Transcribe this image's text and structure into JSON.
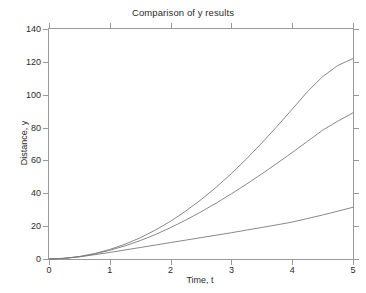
{
  "chart_data": {
    "type": "line",
    "title": "Comparison of y results",
    "xlabel": "Time, t",
    "ylabel": "Distance, y",
    "xlim": [
      0,
      5
    ],
    "ylim": [
      0,
      140
    ],
    "xticks": [
      0,
      1,
      2,
      3,
      4,
      5
    ],
    "yticks": [
      0,
      20,
      40,
      60,
      80,
      100,
      120,
      140
    ],
    "xtick_labels": [
      "0",
      "1",
      "2",
      "3",
      "4",
      "5"
    ],
    "ytick_labels": [
      "0",
      "20",
      "40",
      "60",
      "80",
      "100",
      "120",
      "140"
    ],
    "grid": false,
    "legend": "none",
    "line_color": "#7a7a7a",
    "axis_color": "#9a9a9a",
    "text_color": "#2b2b2b",
    "background": "#ffffff",
    "x": [
      0,
      0.25,
      0.5,
      0.75,
      1,
      1.25,
      1.5,
      1.75,
      2,
      2.25,
      2.5,
      2.75,
      3,
      3.25,
      3.5,
      3.75,
      4,
      4.25,
      4.5,
      4.75,
      5
    ],
    "series": [
      {
        "name": "curve-1",
        "values": [
          0,
          0.4,
          1.5,
          3.3,
          5.8,
          9.0,
          12.9,
          17.6,
          23.0,
          29.2,
          36.1,
          43.7,
          52.0,
          61.0,
          70.6,
          80.7,
          91.2,
          101.8,
          111.0,
          117.8,
          122.0
        ]
      },
      {
        "name": "curve-2",
        "values": [
          0,
          0.4,
          1.4,
          3.1,
          5.3,
          8.0,
          11.2,
          14.9,
          19.1,
          23.7,
          28.7,
          34.0,
          39.7,
          45.6,
          51.8,
          58.2,
          64.8,
          71.6,
          78.4,
          83.9,
          89.0
        ]
      },
      {
        "name": "curve-3",
        "values": [
          0,
          0.4,
          1.3,
          2.6,
          4.0,
          5.5,
          7.0,
          8.5,
          10.0,
          11.5,
          13.0,
          14.5,
          16.0,
          17.6,
          19.2,
          20.8,
          22.5,
          24.6,
          26.8,
          29.1,
          31.5
        ]
      }
    ]
  }
}
